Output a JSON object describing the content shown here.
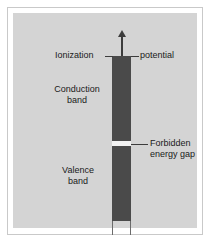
{
  "figure": {
    "colors": {
      "page_background": "#ffffff",
      "frame_border": "#c9c9c9",
      "panel_background": "#d4d4d4",
      "band_fill": "#4a4a4a",
      "gap_fill": "#f2f2f2",
      "line": "#3c3c3c",
      "text": "#1a1a1a"
    },
    "labels": {
      "ionization": "Ionization",
      "potential": "potential",
      "conduction_band_line1": "Conduction",
      "conduction_band_line2": "band",
      "valence_band_line1": "Valence",
      "valence_band_line2": "band",
      "forbidden_gap_line1": "Forbidden",
      "forbidden_gap_line2": "energy gap"
    }
  },
  "chart_data": {
    "type": "bar",
    "xlabel": "",
    "ylabel": "Energy",
    "orientation": "vertical",
    "categories": [
      "Valence band",
      "Forbidden energy gap",
      "Conduction band"
    ],
    "values": [
      75,
      5,
      85
    ],
    "regions": [
      {
        "name": "Conduction band",
        "label": "Conduction band",
        "fill": "#4a4a4a",
        "top_px": 43,
        "height_px": 85
      },
      {
        "name": "Forbidden energy gap",
        "label": "Forbidden energy gap",
        "fill": "#f2f2f2",
        "top_px": 128,
        "height_px": 5
      },
      {
        "name": "Valence band",
        "label": "Valence band",
        "fill": "#4a4a4a",
        "top_px": 133,
        "height_px": 75
      }
    ],
    "annotations": [
      {
        "text": "Ionization",
        "side": "left",
        "points_to": "top of conduction band"
      },
      {
        "text": "potential",
        "side": "right",
        "points_to": "top of conduction band"
      },
      {
        "text": "Forbidden energy gap",
        "side": "right",
        "points_to": "white gap between bands"
      }
    ],
    "arrows": [
      {
        "name": "energy-axis-arrow",
        "direction": "up",
        "at": "top of conduction band"
      }
    ],
    "grid": false,
    "legend": false
  }
}
